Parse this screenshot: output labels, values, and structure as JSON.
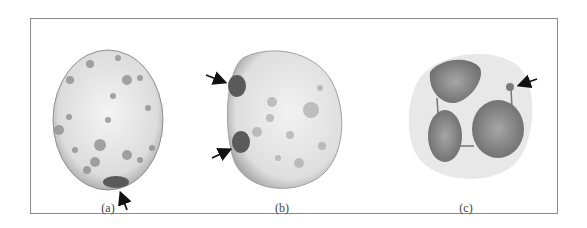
{
  "figure": {
    "panels": [
      {
        "id": "a",
        "label": "(a)",
        "description": "Oval nucleus with a single dark spot at the bottom edge indicated by an arrow"
      },
      {
        "id": "b",
        "label": "(b)",
        "description": "Rounded nucleus with two dark spots on the left edge indicated by two arrows"
      },
      {
        "id": "c",
        "label": "(c)",
        "description": "Three-lobed nucleus connected by thin strands with a small drumstick appendage indicated by an arrow"
      }
    ]
  },
  "colors": {
    "frame": "#8a8a8a",
    "nucleus_fill": "#e8e8e8",
    "spot_dark": "#555555",
    "lobe_fill": "#8c8c8c",
    "cytoplasm": "#e6e6e6",
    "arrow": "#111111"
  }
}
